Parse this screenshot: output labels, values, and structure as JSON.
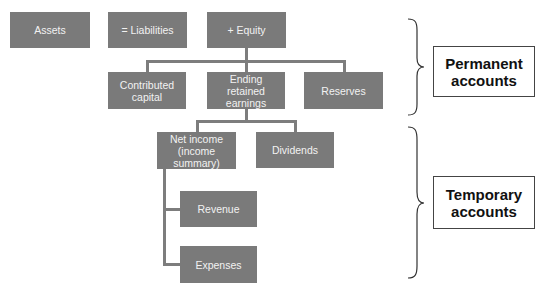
{
  "diagram": {
    "row1": {
      "assets": "Assets",
      "liabilities": "= Liabilities",
      "equity": "+ Equity"
    },
    "row2": {
      "contributed_capital": "Contributed\ncapital",
      "ending_retained_earnings": "Ending retained\nearnings",
      "reserves": "Reserves"
    },
    "row3": {
      "net_income": "Net income\n(income\nsummary)",
      "dividends": "Dividends"
    },
    "row4": {
      "revenue": "Revenue",
      "expenses": "Expenses"
    },
    "groups": {
      "permanent": "Permanent\naccounts",
      "temporary": "Temporary\naccounts"
    },
    "colors": {
      "node_fill": "#7a7a7a",
      "node_text": "#f2f2f2",
      "connector": "#7d7d7d",
      "label_border": "#444444"
    }
  }
}
